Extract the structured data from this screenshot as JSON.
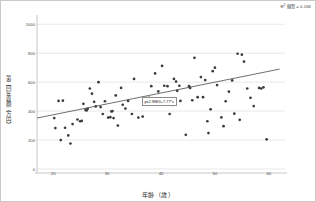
{
  "chart_data": {
    "type": "scatter",
    "title": "",
    "xlabel": "年齢（歳）",
    "ylabel": "第二回年収額（万円）",
    "r2_label": "R² 線型 = 0.166",
    "r2_prefix": "R",
    "r2_sup": "2",
    "r2_rest": " 線型 = 0.166",
    "fit_equation": "y=2.98E3+7.77*x",
    "xlim": [
      17,
      63
    ],
    "ylim": [
      0,
      1050
    ],
    "xticks": [
      20,
      30,
      40,
      50,
      60
    ],
    "yticks": [
      0,
      200,
      400,
      600,
      800,
      1000
    ],
    "grid": true,
    "legend": "none",
    "fit_line": {
      "x0": 17.0,
      "y0": 352,
      "x1": 62.0,
      "y1": 690
    },
    "marker_color": "#3b3b3b",
    "line_color": "#4a4a4a",
    "grid_color": "#d8d8d8",
    "points": [
      [
        20.2,
        352
      ],
      [
        20.4,
        283
      ],
      [
        21.0,
        470
      ],
      [
        21.4,
        200
      ],
      [
        21.8,
        472
      ],
      [
        22.2,
        285
      ],
      [
        22.8,
        232
      ],
      [
        23.2,
        176
      ],
      [
        23.6,
        310
      ],
      [
        24.5,
        342
      ],
      [
        25.0,
        330
      ],
      [
        25.3,
        332
      ],
      [
        25.6,
        450
      ],
      [
        26.0,
        408
      ],
      [
        26.2,
        404
      ],
      [
        26.4,
        416
      ],
      [
        26.8,
        556
      ],
      [
        27.2,
        520
      ],
      [
        27.6,
        464
      ],
      [
        27.9,
        432
      ],
      [
        28.4,
        600
      ],
      [
        28.8,
        428
      ],
      [
        29.2,
        380
      ],
      [
        29.6,
        468
      ],
      [
        30.2,
        355
      ],
      [
        30.6,
        358
      ],
      [
        30.8,
        398
      ],
      [
        31.0,
        400
      ],
      [
        31.2,
        352
      ],
      [
        31.6,
        508
      ],
      [
        32.0,
        300
      ],
      [
        32.6,
        560
      ],
      [
        32.9,
        444
      ],
      [
        33.4,
        418
      ],
      [
        33.9,
        470
      ],
      [
        34.6,
        380
      ],
      [
        35.0,
        622
      ],
      [
        35.8,
        355
      ],
      [
        36.6,
        362
      ],
      [
        37.4,
        490
      ],
      [
        37.8,
        492
      ],
      [
        38.2,
        572
      ],
      [
        38.9,
        660
      ],
      [
        39.5,
        536
      ],
      [
        40.2,
        712
      ],
      [
        40.6,
        575
      ],
      [
        41.2,
        572
      ],
      [
        41.6,
        380
      ],
      [
        42.2,
        442
      ],
      [
        42.4,
        622
      ],
      [
        42.8,
        604
      ],
      [
        43.0,
        540
      ],
      [
        43.4,
        575
      ],
      [
        43.6,
        470
      ],
      [
        44.6,
        236
      ],
      [
        45.2,
        572
      ],
      [
        45.4,
        560
      ],
      [
        45.8,
        475
      ],
      [
        46.2,
        768
      ],
      [
        46.8,
        496
      ],
      [
        47.4,
        635
      ],
      [
        47.8,
        496
      ],
      [
        48.2,
        614
      ],
      [
        48.6,
        330
      ],
      [
        48.8,
        248
      ],
      [
        49.2,
        412
      ],
      [
        49.6,
        676
      ],
      [
        50.0,
        700
      ],
      [
        50.4,
        580
      ],
      [
        51.2,
        356
      ],
      [
        51.6,
        296
      ],
      [
        52.0,
        468
      ],
      [
        52.6,
        534
      ],
      [
        53.2,
        612
      ],
      [
        53.6,
        382
      ],
      [
        54.2,
        796
      ],
      [
        54.6,
        340
      ],
      [
        55.0,
        790
      ],
      [
        55.4,
        742
      ],
      [
        56.0,
        556
      ],
      [
        56.6,
        492
      ],
      [
        57.2,
        435
      ],
      [
        58.2,
        560
      ],
      [
        58.6,
        556
      ],
      [
        59.0,
        564
      ],
      [
        59.6,
        205
      ]
    ]
  },
  "fit_label_position": {
    "x_value": 36.4,
    "y_value": 495
  }
}
